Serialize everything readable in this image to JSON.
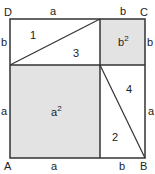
{
  "figure": {
    "vertices": {
      "A": "A",
      "B": "B",
      "C": "C",
      "D": "D"
    },
    "top_labels": {
      "left": "a",
      "right": "b"
    },
    "bottom_labels": {
      "left": "a",
      "right": "b"
    },
    "left_labels": {
      "top": "b",
      "bottom": "a"
    },
    "right_labels": {
      "top": "b",
      "bottom": "a"
    },
    "regions": {
      "t1": "1",
      "t2": "2",
      "t3": "3",
      "t4": "4",
      "a_sq": "a",
      "a_sq_exp": "2",
      "b_sq": "b",
      "b_sq_exp": "2"
    },
    "colors": {
      "shade": "#e3e3e3",
      "line": "#333333"
    }
  }
}
